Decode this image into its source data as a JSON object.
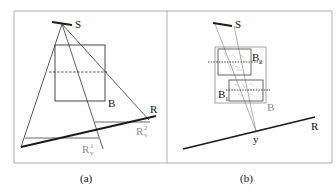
{
  "figure": {
    "panels": [
      {
        "id": "a",
        "caption": "(a)",
        "labels": {
          "source": "S",
          "box": "B",
          "receiver": "R",
          "rv1_main": "R",
          "rv1_sub": "v",
          "rv1_sup": "1",
          "rv2_main": "R",
          "rv2_sub": "v",
          "rv2_sup": "2"
        }
      },
      {
        "id": "b",
        "caption": "(b)",
        "labels": {
          "source": "S",
          "box": "B",
          "box1_main": "B",
          "box1_sub": "1",
          "box2_main": "B",
          "box2_sub": "2",
          "receiver": "R",
          "point": "y"
        }
      }
    ],
    "colors": {
      "line": "#1a1a1a",
      "gray": "#9a9a9a",
      "frame": "#b0b0b0"
    }
  }
}
